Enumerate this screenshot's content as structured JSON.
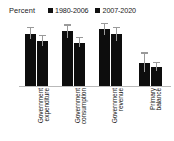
{
  "chart_data": {
    "type": "bar",
    "title": "",
    "subtitle": "",
    "xlabel": "",
    "ylabel": "Percent",
    "ylim": [
      0,
      14
    ],
    "yticks": [
      0,
      2,
      4,
      6,
      8,
      10,
      12,
      14
    ],
    "grid": false,
    "legend_position": "top",
    "categories": [
      "Government expenditure",
      "Government consumption",
      "Government revenue",
      "Primary balance"
    ],
    "series": [
      {
        "name": "1980-2006",
        "color": "#0d0d0d",
        "values": [
          11.3,
          11.9,
          12.2,
          5.0
        ],
        "error_low": [
          10.2,
          10.3,
          11.0,
          3.0
        ],
        "error_high": [
          12.4,
          13.0,
          13.3,
          7.0
        ]
      },
      {
        "name": "2007-2020",
        "color": "#0d0d0d",
        "values": [
          9.8,
          9.3,
          11.1,
          4.0
        ],
        "error_low": [
          8.7,
          8.4,
          9.8,
          3.2
        ],
        "error_high": [
          10.8,
          10.3,
          12.4,
          5.0
        ]
      }
    ]
  },
  "axis": {
    "ylabel": "Percent",
    "ytick_labels": [
      "14",
      "12",
      "10",
      "8",
      "6",
      "4",
      "2",
      "0"
    ]
  },
  "legend": {
    "items": [
      {
        "label": "1980-2006"
      },
      {
        "label": "2007-2020"
      }
    ]
  },
  "categories": [
    {
      "line1": "Government",
      "line2": "expenditure"
    },
    {
      "line1": "Government",
      "line2": "consumption"
    },
    {
      "line1": "Government",
      "line2": "revenue"
    },
    {
      "line1": "Primary",
      "line2": "balance"
    }
  ]
}
